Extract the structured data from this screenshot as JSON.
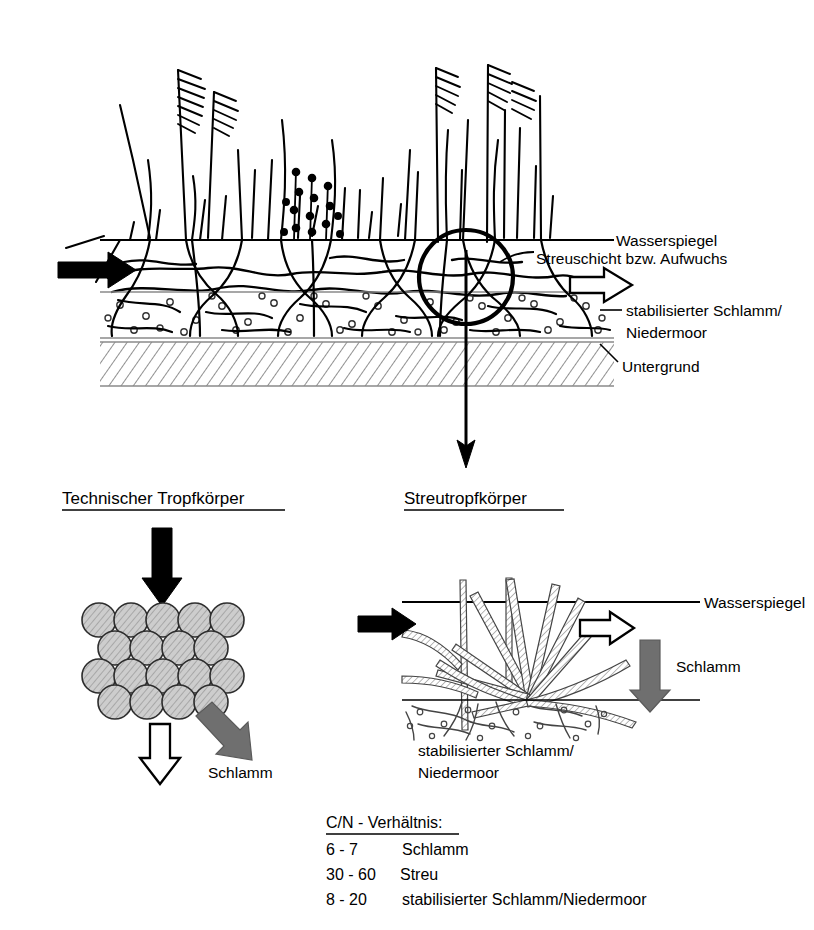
{
  "figure": {
    "title_top_section": "Streutropfkörper Schema",
    "colors": {
      "ink": "#000000",
      "sludge_gray": "#6f6f6f",
      "sphere_gray": "#b0b0b0",
      "hatch_gray": "#555555",
      "background": "#ffffff"
    }
  },
  "top_diagram": {
    "labels": {
      "wasserspiegel": "Wasserspiegel",
      "streuschicht": "Streuschicht bzw. Aufwuchs",
      "stabilisierter_schlamm": "stabilisierter Schlamm/",
      "niedermoor": "Niedermoor",
      "untergrund": "Untergrund"
    },
    "arrows": {
      "inflow": "black-solid-arrow-right",
      "outflow": "white-hollow-arrow-right",
      "callout_down": "black-thin-arrow-down"
    },
    "callout": "circle-highlight-plant-base"
  },
  "headings": {
    "technischer_tropfkoerper": "Technischer Tropfkörper",
    "streutropfkoerper": "Streutropfkörper"
  },
  "filter_diagram": {
    "inflow_arrow": "black-solid-arrow-down",
    "media": {
      "name": "hatched-sphere-stack",
      "rows": [
        5,
        4,
        5,
        4
      ]
    },
    "outflow_arrow": "white-hollow-arrow-down",
    "sludge_arrow": "gray-arrow-diagonal",
    "sludge_label": "Schlamm"
  },
  "detail_diagram": {
    "labels": {
      "wasserspiegel": "Wasserspiegel",
      "schlamm": "Schlamm",
      "stabilisierter_schlamm": "stabilisierter Schlamm/",
      "niedermoor": "Niedermoor"
    },
    "arrows": {
      "inflow": "black-solid-arrow-right",
      "outflow": "white-hollow-arrow-right",
      "sludge": "gray-arrow-down"
    }
  },
  "cn_legend": {
    "title": "C/N - Verhältnis:",
    "rows": [
      {
        "ratio": "6 - 7",
        "material": "Schlamm"
      },
      {
        "ratio": "30 - 60",
        "material": "Streu"
      },
      {
        "ratio": "8 - 20",
        "material": "stabilisierter Schlamm/Niedermoor"
      }
    ]
  }
}
